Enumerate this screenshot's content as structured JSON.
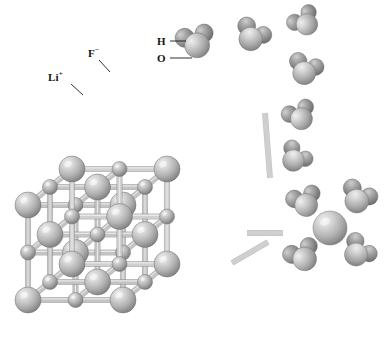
{
  "figure": {
    "kind": "molecular-structure-illustration",
    "background_color": "#ffffff",
    "width": 392,
    "height": 340
  },
  "labels": [
    {
      "id": "li-cation",
      "name": "lithium-ion-label",
      "text": "Li",
      "charge": "+",
      "x": 48,
      "y": 72,
      "leader": {
        "x1": 71,
        "y1": 84,
        "x2": 83,
        "y2": 95
      }
    },
    {
      "id": "f-anion",
      "name": "fluoride-ion-label",
      "text": "F",
      "charge": "−",
      "x": 88,
      "y": 48,
      "leader": {
        "x1": 99,
        "y1": 60,
        "x2": 110,
        "y2": 72
      }
    },
    {
      "id": "h-atom",
      "name": "hydrogen-atom-label",
      "text": "H",
      "charge": "",
      "x": 157,
      "y": 36,
      "leader": {
        "x1": 170,
        "y1": 41,
        "x2": 186,
        "y2": 41
      }
    },
    {
      "id": "o-atom",
      "name": "oxygen-atom-label",
      "text": "O",
      "charge": "",
      "x": 157,
      "y": 53,
      "leader": {
        "x1": 170,
        "y1": 58,
        "x2": 192,
        "y2": 58
      }
    }
  ],
  "legend_keys": [
    {
      "species": "Li+",
      "role": "cation",
      "sphere": "small",
      "color": "#a8a8a8"
    },
    {
      "species": "F-",
      "role": "anion",
      "sphere": "large",
      "color": "#b4b4b4"
    },
    {
      "species": "H",
      "role": "atom",
      "sphere": "small",
      "color": "#8f8f8f"
    },
    {
      "species": "O",
      "role": "atom",
      "sphere": "large",
      "color": "#bdbdbd"
    }
  ],
  "lattice": {
    "name": "rock-salt-unit-cell",
    "type": "NaCl-type face-centered cubic",
    "nodes_per_edge": 3,
    "cation_color": "#a9a9a9",
    "anion_color": "#b6b6b6",
    "bond_color": "#c4c4c4",
    "bond_color_dark": "#8c8c8c",
    "origin": {
      "x": 28,
      "y": 300
    },
    "axis_x": {
      "dx": 95,
      "dy": 0
    },
    "axis_y": {
      "dx": 0,
      "dy": -95
    },
    "axis_z": {
      "dx": 44,
      "dy": -36
    },
    "anion_radius": 13,
    "cation_radius": 7.5,
    "bond_thickness": 4.5
  },
  "water_molecules": [
    {
      "id": "w1",
      "name": "water-molecule",
      "x": 196,
      "y": 42,
      "scale": 1.0,
      "rotation": -18
    },
    {
      "id": "w2",
      "name": "water-molecule",
      "x": 252,
      "y": 36,
      "scale": 0.94,
      "rotation": 24
    },
    {
      "id": "w3",
      "name": "water-molecule",
      "x": 305,
      "y": 22,
      "scale": 0.86,
      "rotation": -40
    },
    {
      "id": "w4",
      "name": "water-molecule",
      "x": 305,
      "y": 70,
      "scale": 0.92,
      "rotation": 14
    },
    {
      "id": "w5",
      "name": "water-molecule",
      "x": 300,
      "y": 116,
      "scale": 0.88,
      "rotation": -28
    },
    {
      "id": "w6",
      "name": "water-molecule",
      "x": 295,
      "y": 158,
      "scale": 0.86,
      "rotation": 34
    }
  ],
  "hydrated_cluster": {
    "name": "hydrated-ion-cluster",
    "center_ion": {
      "x": 330,
      "y": 228,
      "radius": 17,
      "color": "#bbbbbb"
    },
    "waters": [
      {
        "id": "hw1",
        "name": "water-molecule",
        "x": 305,
        "y": 202,
        "scale": 0.92,
        "rotation": -22
      },
      {
        "id": "hw2",
        "name": "water-molecule",
        "x": 358,
        "y": 198,
        "scale": 0.95,
        "rotation": 22
      },
      {
        "id": "hw3",
        "name": "water-molecule",
        "x": 303,
        "y": 256,
        "scale": 0.95,
        "rotation": -30
      },
      {
        "id": "hw4",
        "name": "water-molecule",
        "x": 358,
        "y": 252,
        "scale": 0.92,
        "rotation": 38
      }
    ]
  },
  "dangling_bonds": [
    {
      "name": "broken-bond-stub",
      "x1": 265,
      "y1": 113,
      "x2": 270,
      "y2": 178
    },
    {
      "name": "broken-bond-stub",
      "x1": 247,
      "y1": 233,
      "x2": 283,
      "y2": 233
    },
    {
      "name": "broken-bond-stub",
      "x1": 232,
      "y1": 263,
      "x2": 268,
      "y2": 242
    }
  ]
}
